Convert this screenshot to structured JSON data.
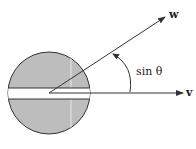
{
  "diagram": {
    "vector_w_label": "w",
    "vector_v_label": "v",
    "angle_label": "sin θ",
    "colors": {
      "disk_fill": "#bdbdbd",
      "stroke": "#333333",
      "slot_fill": "#ffffff"
    }
  }
}
